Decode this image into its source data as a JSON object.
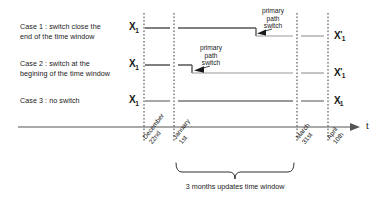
{
  "diagram": {
    "colors": {
      "ink": "#1a1a1a",
      "line_dark": "#555555",
      "line_light": "#9a9a9a",
      "dashed": "#3a3a3a"
    },
    "cases": [
      {
        "id": "case-1",
        "label": "Case 1 : switch close the\nend of the time window",
        "start_value": "X",
        "start_sub": "1",
        "end_value": "X",
        "end_prime": "'",
        "end_sub": "1",
        "switch_annotation": "primary\npath\nswitch",
        "switch_date": "close to March 31st"
      },
      {
        "id": "case-2",
        "label": "Case 2 : switch at the\nbegining of the time window",
        "start_value": "X",
        "start_sub": "1",
        "end_value": "X",
        "end_prime": "'",
        "end_sub": "1",
        "switch_annotation": "primary\npath\nswitch",
        "switch_date": "close to January 1st"
      },
      {
        "id": "case-3",
        "label": "Case 3 : no switch",
        "start_value": "X",
        "start_sub": "1",
        "end_value": "X",
        "end_prime": "",
        "end_sub": "1",
        "switch_annotation": "",
        "switch_date": ""
      }
    ],
    "axis": {
      "name": "t",
      "ticks": [
        {
          "id": "tick-december-22nd",
          "label": "December\n22nd"
        },
        {
          "id": "tick-january-1st",
          "label": "January\n1st"
        },
        {
          "id": "tick-march-31st",
          "label": "March\n31st"
        },
        {
          "id": "tick-april-10th",
          "label": "April\n10th"
        }
      ]
    },
    "brace": {
      "caption": "3 months updates time window",
      "from": "January 1st",
      "to": "March 31st"
    }
  }
}
